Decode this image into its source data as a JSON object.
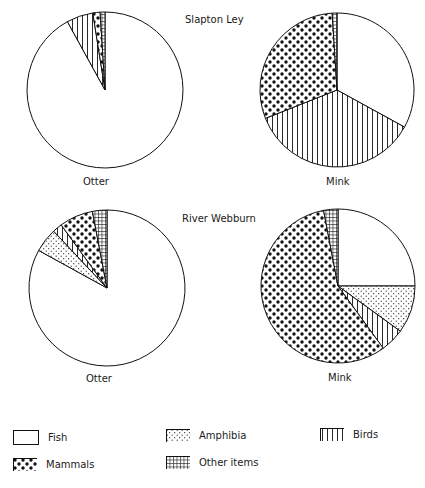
{
  "chart_data": [
    {
      "type": "pie",
      "title": "Slapton Ley",
      "label": "Otter",
      "categories": [
        "Fish",
        "Birds",
        "Mammals",
        "Other items"
      ],
      "values": [
        92,
        5.5,
        1.5,
        1
      ]
    },
    {
      "type": "pie",
      "title": "Slapton Ley",
      "label": "Mink",
      "categories": [
        "Fish",
        "Birds",
        "Mammals",
        "Other items"
      ],
      "values": [
        33,
        36,
        30,
        1
      ]
    },
    {
      "type": "pie",
      "title": "River Webburn",
      "label": "Otter",
      "categories": [
        "Fish",
        "Amphibia",
        "Birds",
        "Mammals",
        "Other items"
      ],
      "values": [
        83,
        5,
        2,
        7,
        3
      ]
    },
    {
      "type": "pie",
      "title": "River Webburn",
      "label": "Mink",
      "categories": [
        "Fish",
        "Amphibia",
        "Birds",
        "Mammals",
        "Other items"
      ],
      "values": [
        25,
        10,
        5,
        57,
        3
      ]
    }
  ],
  "titles": {
    "slapton": "Slapton Ley",
    "webburn": "River Webburn"
  },
  "pie_labels": {
    "otter_top": "Otter",
    "mink_top": "Mink",
    "otter_bottom": "Otter",
    "mink_bottom": "Mink"
  },
  "legend": [
    {
      "key": "fish",
      "label": "Fish"
    },
    {
      "key": "amphibia",
      "label": "Amphibia"
    },
    {
      "key": "birds",
      "label": "Birds"
    },
    {
      "key": "mammals",
      "label": "Mammals"
    },
    {
      "key": "other",
      "label": "Other items"
    }
  ]
}
